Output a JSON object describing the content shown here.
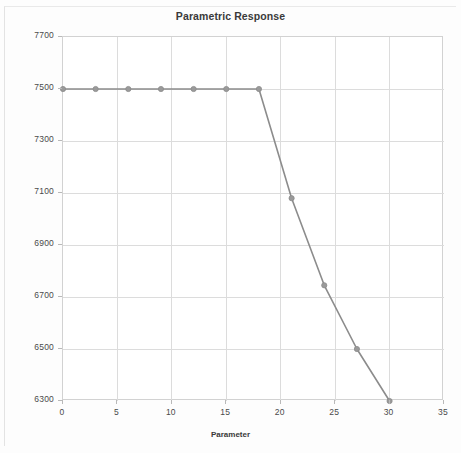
{
  "chart_data": {
    "type": "line",
    "title": "Parametric Response",
    "xlabel": "Parameter",
    "ylabel": "Objective",
    "xlim": [
      0,
      35
    ],
    "ylim": [
      6300,
      7700
    ],
    "xticks": [
      0,
      5,
      10,
      15,
      20,
      25,
      30,
      35
    ],
    "yticks": [
      6300,
      6500,
      6700,
      6900,
      7100,
      7300,
      7500,
      7700
    ],
    "xtick_labels": [
      "0",
      "5",
      "10",
      "15",
      "20",
      "25",
      "30",
      "35"
    ],
    "ytick_labels": [
      "6300",
      "6500",
      "6700",
      "6900",
      "7100",
      "7300",
      "7500",
      "7700"
    ],
    "grid": true,
    "legend": null,
    "series": [
      {
        "name": "Objective",
        "color": "#8c8c8c",
        "marker": "circle",
        "marker_color": "#9a9a9a",
        "x": [
          0,
          3,
          6,
          9,
          12,
          15,
          18,
          21,
          24,
          27,
          30
        ],
        "values": [
          7500,
          7500,
          7500,
          7500,
          7500,
          7500,
          7500,
          7080,
          6745,
          6500,
          6300
        ]
      }
    ]
  },
  "style": {
    "background": "#fdfdfd",
    "plot_background": "#ffffff",
    "grid_color": "#dcdcdc",
    "axis_color": "#d2d2d2",
    "text_color": "#4a4a4a",
    "title_color": "#3a3a3a",
    "line_color": "#8c8c8c"
  }
}
